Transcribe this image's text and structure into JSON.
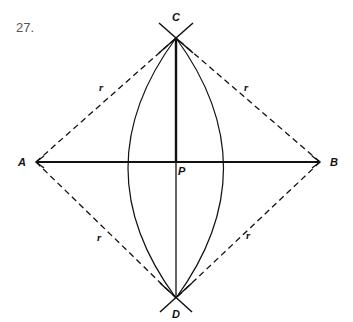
{
  "figure": {
    "number": "27.",
    "points": {
      "A": {
        "label": "A",
        "x": 36,
        "y": 162
      },
      "B": {
        "label": "B",
        "x": 320,
        "y": 162
      },
      "C": {
        "label": "C",
        "x": 176,
        "y": 38
      },
      "D": {
        "label": "D",
        "x": 176,
        "y": 298
      },
      "P": {
        "label": "P",
        "x": 176,
        "y": 162
      }
    },
    "radius_labels": [
      "r",
      "r",
      "r",
      "r"
    ],
    "colors": {
      "ink": "#111111",
      "number": "#555555"
    }
  }
}
